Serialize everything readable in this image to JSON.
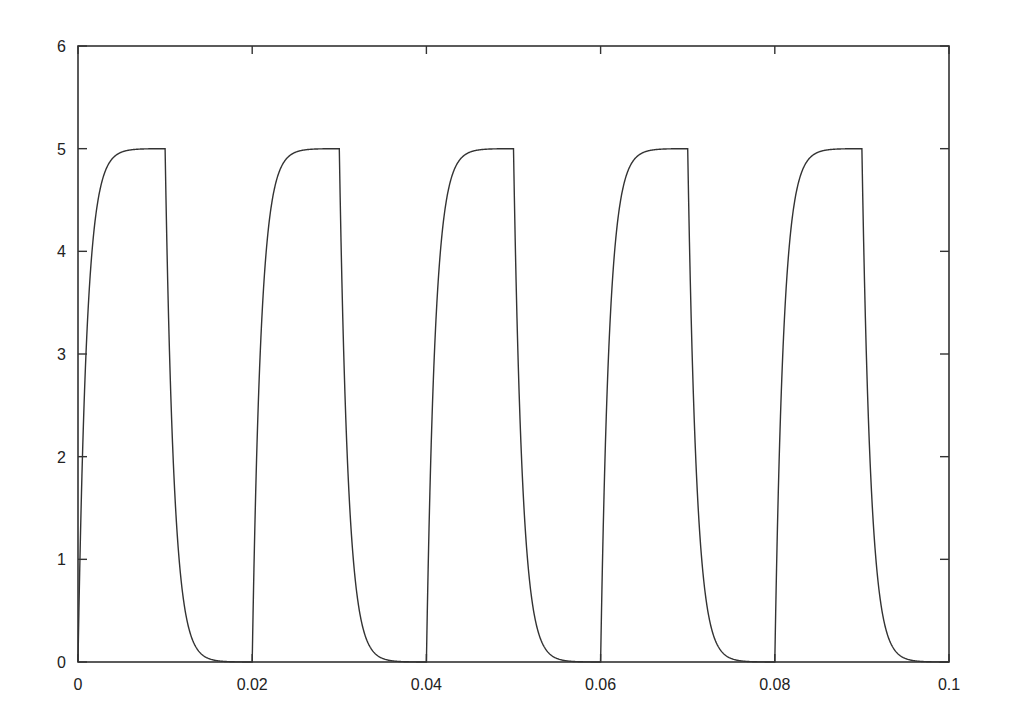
{
  "chart_data": {
    "type": "line",
    "title": "",
    "xlabel": "",
    "ylabel": "",
    "xlim": [
      0,
      0.1
    ],
    "ylim": [
      0,
      6
    ],
    "grid": false,
    "legend": null,
    "x_ticks": [
      0,
      0.02,
      0.04,
      0.06,
      0.08,
      0.1
    ],
    "x_tick_labels": [
      "0",
      "0.02",
      "0.04",
      "0.06",
      "0.08",
      "0.1"
    ],
    "y_ticks": [
      0,
      1,
      2,
      3,
      4,
      5,
      6
    ],
    "y_tick_labels": [
      "0",
      "1",
      "2",
      "3",
      "4",
      "5",
      "6"
    ],
    "signal": {
      "amplitude": 5,
      "period": 0.02,
      "high_duration": 0.01,
      "time_constant": 0.001,
      "pulses": 5
    },
    "series": [
      {
        "name": "voltage",
        "color": "#333333",
        "x": [
          0,
          0.0005,
          0.001,
          0.002,
          0.003,
          0.005,
          0.0099,
          0.01,
          0.0105,
          0.011,
          0.012,
          0.013,
          0.015,
          0.0199,
          0.02,
          0.0205,
          0.021,
          0.022,
          0.023,
          0.025,
          0.0299,
          0.03,
          0.0305,
          0.031,
          0.032,
          0.033,
          0.035,
          0.0399,
          0.04,
          0.0405,
          0.041,
          0.042,
          0.043,
          0.045,
          0.0499,
          0.05,
          0.0505,
          0.051,
          0.052,
          0.053,
          0.055,
          0.0599,
          0.06,
          0.0605,
          0.061,
          0.062,
          0.063,
          0.065,
          0.0699,
          0.07,
          0.0705,
          0.071,
          0.072,
          0.073,
          0.075,
          0.0799,
          0.08,
          0.0805,
          0.081,
          0.082,
          0.083,
          0.085,
          0.0899,
          0.09,
          0.0905,
          0.091,
          0.092,
          0.093,
          0.095,
          0.1
        ],
        "values": [
          0,
          1.97,
          3.16,
          4.32,
          4.75,
          4.97,
          5.0,
          5.0,
          3.03,
          1.84,
          0.68,
          0.25,
          0.03,
          0.0,
          0,
          1.97,
          3.16,
          4.32,
          4.75,
          4.97,
          5.0,
          5.0,
          3.03,
          1.84,
          0.68,
          0.25,
          0.03,
          0.0,
          0,
          1.97,
          3.16,
          4.32,
          4.75,
          4.97,
          5.0,
          5.0,
          3.03,
          1.84,
          0.68,
          0.25,
          0.03,
          0.0,
          0,
          1.97,
          3.16,
          4.32,
          4.75,
          4.97,
          5.0,
          5.0,
          3.03,
          1.84,
          0.68,
          0.25,
          0.03,
          0.0,
          0,
          1.97,
          3.16,
          4.32,
          4.75,
          4.97,
          5.0,
          5.0,
          3.03,
          1.84,
          0.68,
          0.25,
          0.03,
          0.0
        ]
      }
    ]
  },
  "axes": {
    "x_labels": [
      "0",
      "0.02",
      "0.04",
      "0.06",
      "0.08",
      "0.1"
    ],
    "y_labels": [
      "0",
      "1",
      "2",
      "3",
      "4",
      "5",
      "6"
    ]
  },
  "style": {
    "axis_color": "#333333",
    "line_color": "#333333",
    "background": "#ffffff"
  }
}
